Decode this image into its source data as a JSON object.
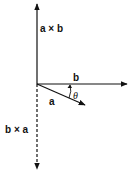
{
  "diagram": {
    "labels": {
      "a_cross_b": "a × b",
      "b_cross_a": "b × a",
      "vector_b": "b",
      "vector_a": "a",
      "angle": "θ"
    },
    "colors": {
      "line": "#111111",
      "background": "#ffffff"
    },
    "vectors": [
      {
        "name": "a × b",
        "direction": "up",
        "style": "solid"
      },
      {
        "name": "b",
        "direction": "right",
        "style": "solid"
      },
      {
        "name": "a",
        "direction": "down-right",
        "style": "solid"
      },
      {
        "name": "b × a",
        "direction": "down",
        "style": "dashed"
      }
    ]
  }
}
